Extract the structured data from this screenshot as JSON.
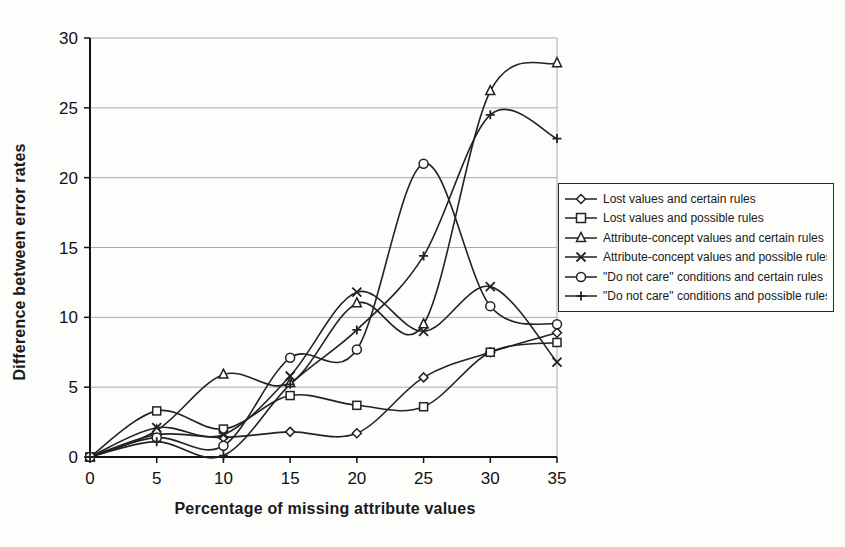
{
  "chart_data": {
    "type": "line",
    "title": "",
    "xlabel": "Percentage of missing attribute values",
    "ylabel": "Difference between error rates",
    "x": [
      0,
      5,
      10,
      15,
      20,
      25,
      30,
      35
    ],
    "xticks": [
      0,
      5,
      10,
      15,
      20,
      25,
      30,
      35
    ],
    "yticks": [
      0,
      5,
      10,
      15,
      20,
      25,
      30
    ],
    "xlim": [
      0,
      35
    ],
    "ylim": [
      0,
      30
    ],
    "grid": "horizontal-gridlines-on",
    "legend_position": "right",
    "line_color": "#222222",
    "grid_color": "#aaaaaa",
    "series": [
      {
        "name": "Lost values and certain rules",
        "marker": "diamond",
        "values": [
          0,
          1.6,
          1.4,
          1.8,
          1.7,
          5.7,
          7.5,
          8.9
        ]
      },
      {
        "name": "Lost values and possible rules",
        "marker": "square",
        "values": [
          0,
          3.3,
          2.0,
          4.4,
          3.7,
          3.6,
          7.5,
          8.2
        ]
      },
      {
        "name": "Attribute-concept values and certain rules",
        "marker": "triangle",
        "values": [
          0,
          1.9,
          5.9,
          5.3,
          11.0,
          9.5,
          26.2,
          28.2
        ]
      },
      {
        "name": "Attribute-concept values and possible rules",
        "marker": "x",
        "values": [
          0,
          2.1,
          1.6,
          5.8,
          11.8,
          9.0,
          12.2,
          6.8
        ]
      },
      {
        "name": "\"Do not care\" conditions and certain rules",
        "marker": "circle",
        "values": [
          0,
          1.4,
          0.8,
          7.1,
          7.7,
          21.0,
          10.8,
          9.5
        ]
      },
      {
        "name": "\"Do not care\" conditions and possible rules",
        "marker": "plus",
        "values": [
          0,
          1.1,
          0.1,
          5.2,
          9.1,
          14.4,
          24.5,
          22.8
        ]
      }
    ]
  }
}
